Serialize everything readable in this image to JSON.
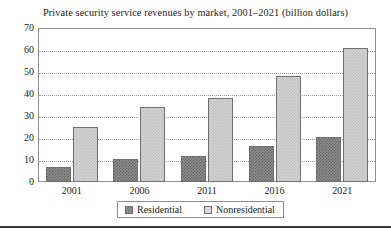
{
  "chart_data": {
    "type": "bar",
    "title": "Private security service revenues by market, 2001–2021 (billion dollars)",
    "xlabel": "",
    "ylabel": "",
    "categories": [
      "2001",
      "2006",
      "2011",
      "2016",
      "2021"
    ],
    "series": [
      {
        "name": "Residential",
        "values": [
          7,
          10.5,
          12,
          16.5,
          20.5
        ],
        "color": "#8e8e8e"
      },
      {
        "name": "Nonresidential",
        "values": [
          25,
          34,
          38,
          48,
          61
        ],
        "color": "#d3d3d3"
      }
    ],
    "ylim": [
      0,
      70
    ],
    "ytick_labels": [
      "70",
      "60",
      "50",
      "40",
      "30",
      "20",
      "10",
      "0"
    ],
    "ytick_values": [
      70,
      60,
      50,
      40,
      30,
      20,
      10,
      0
    ],
    "grid": true,
    "grid_style": "dotted-horizontal",
    "legend_position": "bottom-center",
    "legend": [
      {
        "label": "Residential",
        "swatch": "residential-swatch"
      },
      {
        "label": "Nonresidential",
        "swatch": "nonresidential-swatch"
      }
    ]
  }
}
